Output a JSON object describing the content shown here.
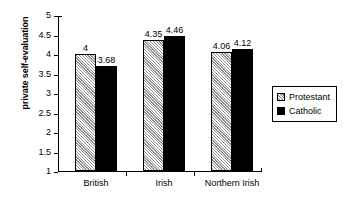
{
  "chart_data": {
    "type": "bar",
    "title": "",
    "xlabel": "",
    "ylabel": "private self-evaluation",
    "ylim": [
      1,
      5
    ],
    "ytick_labels": [
      "5",
      "4.5",
      "4",
      "3.5",
      "3",
      "2.5",
      "2",
      "1.5",
      "1"
    ],
    "ytick_values": [
      5,
      4.5,
      4,
      3.5,
      3,
      2.5,
      2,
      1.5,
      1
    ],
    "grid": false,
    "legend_position": "right",
    "categories": [
      "British",
      "Irish",
      "Northern Irish"
    ],
    "series": [
      {
        "name": "Protestant",
        "values": [
          4,
          4.35,
          4.06
        ],
        "value_labels": [
          "4",
          "4.35",
          "4.06"
        ],
        "fill": "hatched",
        "color": "#d2d2d2"
      },
      {
        "name": "Catholic",
        "values": [
          3.68,
          4.46,
          4.12
        ],
        "value_labels": [
          "3.68",
          "4.46",
          "4.12"
        ],
        "fill": "solid",
        "color": "#000000"
      }
    ]
  },
  "legend": {
    "items": [
      {
        "label": "Protestant"
      },
      {
        "label": "Catholic"
      }
    ]
  },
  "colors": {
    "axis": "#000000",
    "protestant": "#d2d2d2",
    "catholic": "#000000",
    "background": "#ffffff"
  }
}
